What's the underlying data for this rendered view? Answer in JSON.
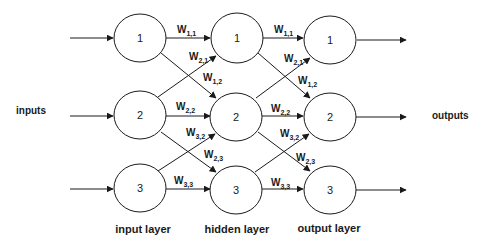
{
  "diagram": {
    "side_labels": {
      "inputs": "inputs",
      "outputs": "outputs"
    },
    "layers": [
      {
        "id": "input",
        "label": "input layer",
        "x": 140,
        "nodes": [
          "1",
          "2",
          "3"
        ]
      },
      {
        "id": "hidden",
        "label": "hidden layer",
        "x": 237,
        "nodes": [
          "1",
          "2",
          "3"
        ]
      },
      {
        "id": "output",
        "label": "output layer",
        "x": 330,
        "nodes": [
          "1",
          "2",
          "3"
        ]
      }
    ],
    "node_rows_y": [
      38,
      116,
      189
    ],
    "weights": {
      "w11": {
        "base": "W",
        "sub": "1,1"
      },
      "w21": {
        "base": "W",
        "sub": "2,1"
      },
      "w12": {
        "base": "W",
        "sub": "1,2"
      },
      "w22": {
        "base": "W",
        "sub": "2,2"
      },
      "w32": {
        "base": "W",
        "sub": "3,2"
      },
      "w23": {
        "base": "W",
        "sub": "2,3"
      },
      "w33": {
        "base": "W",
        "sub": "3,3"
      }
    },
    "colors": {
      "stroke": "#1a1a1a",
      "background": "#ffffff",
      "text": "#1a1a1a"
    }
  }
}
